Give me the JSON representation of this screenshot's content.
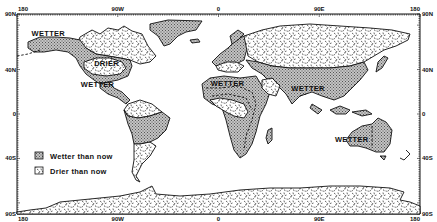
{
  "map": {
    "projection": "equirectangular",
    "lon_range": [
      -180,
      180
    ],
    "lat_range": [
      -90,
      90
    ],
    "top_axis_labels": [
      {
        "lon": -180,
        "text": "180"
      },
      {
        "lon": -90,
        "text": "90W"
      },
      {
        "lon": 0,
        "text": "0"
      },
      {
        "lon": 90,
        "text": "90E"
      },
      {
        "lon": 180,
        "text": "180"
      }
    ],
    "bottom_axis_labels": [
      {
        "lon": -180,
        "text": "180"
      },
      {
        "lon": -90,
        "text": "90W"
      },
      {
        "lon": 0,
        "text": "0"
      },
      {
        "lon": 90,
        "text": "90E"
      },
      {
        "lon": 180,
        "text": "180"
      }
    ],
    "left_axis_labels": [
      {
        "lat": 90,
        "text": "90N"
      },
      {
        "lat": 40,
        "text": "40N"
      },
      {
        "lat": 0,
        "text": "0"
      },
      {
        "lat": -40,
        "text": "40S"
      },
      {
        "lat": -90,
        "text": "90S"
      }
    ],
    "right_axis_labels": [
      {
        "lat": 90,
        "text": "90N"
      },
      {
        "lat": 40,
        "text": "40N"
      },
      {
        "lat": 0,
        "text": "0"
      },
      {
        "lat": -40,
        "text": "40S"
      },
      {
        "lat": -90,
        "text": "90S"
      }
    ],
    "region_labels": [
      {
        "text": "WETTER",
        "lon": -152,
        "lat": 70
      },
      {
        "text": "DRIER",
        "lon": -100,
        "lat": 43
      },
      {
        "text": "WETTER",
        "lon": -108,
        "lat": 24
      },
      {
        "text": "WETTER",
        "lon": 8,
        "lat": 25
      },
      {
        "text": "WETTER",
        "lon": 80,
        "lat": 21
      },
      {
        "text": "WETTER",
        "lon": 119,
        "lat": -25
      }
    ],
    "colors": {
      "ink": "#111111",
      "wetter_fill": "#bdbdbd",
      "background": "#ffffff"
    }
  },
  "legend": {
    "items": [
      {
        "key": "wetter",
        "label": "Wetter than now",
        "pattern": "stipple"
      },
      {
        "key": "drier",
        "label": "Drier than now",
        "pattern": "dashes"
      }
    ]
  }
}
